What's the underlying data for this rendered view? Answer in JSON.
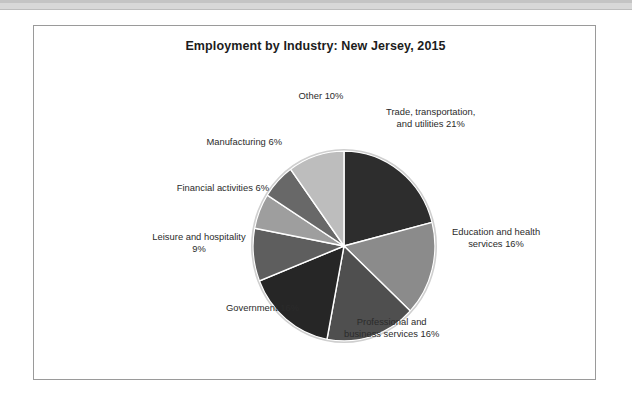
{
  "page": {
    "background_color": "#ffffff",
    "frame_border_color": "#9a9a9a"
  },
  "chart_data": {
    "type": "pie",
    "title": "Employment by Industry: New Jersey, 2015",
    "xlabel": "",
    "ylabel": "",
    "start_angle_deg": 90,
    "direction": "clockwise",
    "legend": "none",
    "grid": false,
    "categories": [
      "Trade, transportation, and utilities",
      "Education and health services",
      "Professional and business services",
      "Government",
      "Leisure and hospitality",
      "Financial activities",
      "Manufacturing",
      "Other"
    ],
    "values": [
      21,
      16,
      16,
      16,
      9,
      6,
      6,
      10
    ],
    "value_unit": "%",
    "slices": [
      {
        "name": "trade-transportation-utilities",
        "label_lines": [
          "Trade, transportation,",
          "and utilities 21%"
        ],
        "value": 21,
        "color": "#2d2d2d"
      },
      {
        "name": "education-health-services",
        "label_lines": [
          "Education and health",
          "services 16%"
        ],
        "value": 16,
        "color": "#8b8b8b"
      },
      {
        "name": "professional-business-services",
        "label_lines": [
          "Professional and",
          "business services 16%"
        ],
        "value": 16,
        "color": "#4f4f4f"
      },
      {
        "name": "government",
        "label_lines": [
          "Government 16%"
        ],
        "value": 16,
        "color": "#262626"
      },
      {
        "name": "leisure-hospitality",
        "label_lines": [
          "Leisure and hospitality",
          "9%"
        ],
        "value": 9,
        "color": "#5e5e5e"
      },
      {
        "name": "financial-activities",
        "label_lines": [
          "Financial activities 6%"
        ],
        "value": 6,
        "color": "#9e9e9e"
      },
      {
        "name": "manufacturing",
        "label_lines": [
          "Manufacturing 6%"
        ],
        "value": 6,
        "color": "#686868"
      },
      {
        "name": "other",
        "label_lines": [
          "Other 10%"
        ],
        "value": 10,
        "color": "#bdbdbd"
      }
    ]
  },
  "labels": {
    "trade_line1": "Trade, transportation,",
    "trade_line2": "and utilities 21%",
    "education_line1": "Education and health",
    "education_line2": "services 16%",
    "professional_line1": "Professional and",
    "professional_line2": "business services 16%",
    "government_line1": "Government 16%",
    "leisure_line1": "Leisure and hospitality",
    "leisure_line2": "9%",
    "financial_line1": "Financial activities 6%",
    "manufacturing_line1": "Manufacturing 6%",
    "other_line1": "Other 10%"
  }
}
